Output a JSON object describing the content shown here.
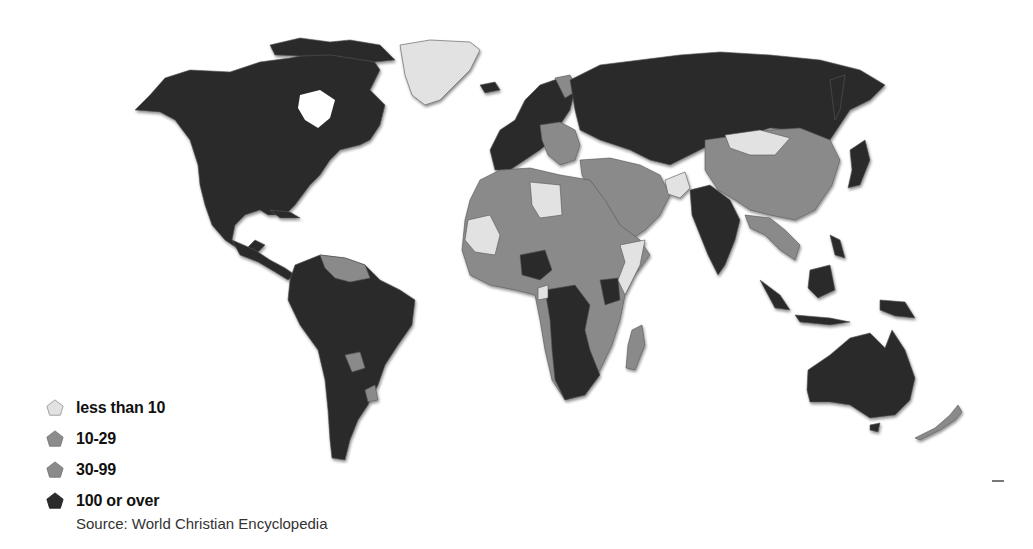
{
  "map": {
    "type": "choropleth",
    "subject": "World map shaded by category (Christian population, per source)",
    "categories": [
      {
        "label": "less than 10",
        "color": "#e2e2e2"
      },
      {
        "label": "10-29",
        "color": "#8c8c8c"
      },
      {
        "label": "30-99",
        "color": "#8a8a8a"
      },
      {
        "label": "100 or over",
        "color": "#2b2b2b"
      }
    ],
    "regions": {
      "north_america": "100 or over",
      "greenland": "less than 10",
      "central_america": "100 or over",
      "south_america": "100 or over",
      "guianas_venezuela_paraguay_uruguay": "30-99",
      "europe_west": "100 or over",
      "europe_east_balkans": "30-99",
      "russia_central_asia": "100 or over",
      "north_africa": "30-99",
      "libya_mali_mauritania": "less than 10",
      "central_africa": "100 or over",
      "east_africa": "30-99",
      "southern_africa": "100 or over",
      "madagascar": "30-99",
      "middle_east": "30-99",
      "afghanistan": "less than 10",
      "india_pakistan": "100 or over",
      "china": "30-99",
      "mongolia": "less than 10",
      "southeast_asia": "30-99",
      "indonesia_philippines": "100 or over",
      "japan_korea": "100 or over",
      "australia": "100 or over",
      "new_zealand": "30-99"
    }
  },
  "legend": {
    "items": [
      {
        "label": "less than 10",
        "color": "#e2e2e2"
      },
      {
        "label": "10-29",
        "color": "#8c8c8c"
      },
      {
        "label": "30-99",
        "color": "#8a8a8a"
      },
      {
        "label": "100 or over",
        "color": "#2b2b2b"
      }
    ]
  },
  "source": "Source: World Christian Encyclopedia"
}
